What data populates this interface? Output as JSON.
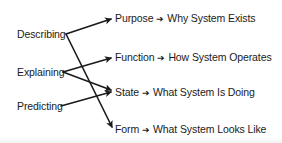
{
  "diagram": {
    "sources": [
      {
        "id": "describing",
        "label": "Describing"
      },
      {
        "id": "explaining",
        "label": "Explaining"
      },
      {
        "id": "predicting",
        "label": "Predicting"
      }
    ],
    "targets": [
      {
        "id": "purpose",
        "term": "Purpose",
        "arrow": "➔",
        "meaning": "Why System Exists"
      },
      {
        "id": "function",
        "term": "Function",
        "arrow": "➔",
        "meaning": "How System Operates"
      },
      {
        "id": "state",
        "term": "State",
        "arrow": "➔",
        "meaning": "What System Is Doing"
      },
      {
        "id": "form",
        "term": "Form",
        "arrow": "➔",
        "meaning": "What System Looks Like"
      }
    ],
    "edges": [
      {
        "from": "describing",
        "to": "purpose"
      },
      {
        "from": "describing",
        "to": "form"
      },
      {
        "from": "explaining",
        "to": "function"
      },
      {
        "from": "explaining",
        "to": "state"
      },
      {
        "from": "predicting",
        "to": "state"
      }
    ],
    "line_color": "#1a1a1a"
  }
}
